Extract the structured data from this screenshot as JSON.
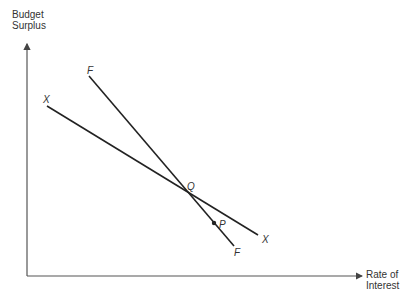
{
  "axes": {
    "y_label_line1": "Budget",
    "y_label_line2": "Surplus",
    "x_label_line1": "Rate of",
    "x_label_line2": "Interest"
  },
  "curves": [
    {
      "name": "F",
      "label_start": "F",
      "label_end": "F",
      "x1": 89,
      "y1": 76,
      "x2": 234,
      "y2": 246
    },
    {
      "name": "X",
      "label_start": "X",
      "label_end": "X",
      "x1": 47,
      "y1": 106,
      "x2": 258,
      "y2": 235
    }
  ],
  "points": [
    {
      "label": "Q",
      "description": "intersection of F and X"
    },
    {
      "label": "P",
      "description": "point below Q on F"
    }
  ],
  "colors": {
    "line": "#222222",
    "axis": "#555555"
  }
}
